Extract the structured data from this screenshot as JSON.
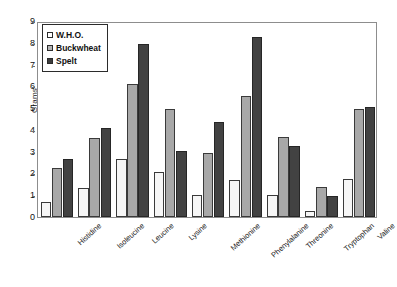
{
  "chart_data": {
    "type": "bar",
    "title": "",
    "xlabel": "",
    "ylabel": "Grams",
    "ylim": [
      0,
      9
    ],
    "yticks": [
      0,
      1,
      2,
      3,
      4,
      5,
      6,
      7,
      8,
      9
    ],
    "grid": false,
    "legend_position": "top-left",
    "categories": [
      "Histidine",
      "Isoleucine",
      "Leucine",
      "Lysine",
      "Methionine",
      "Phenylalanine",
      "Threonine",
      "Tryptophan",
      "Valine"
    ],
    "series": [
      {
        "name": "W.H.O.",
        "color": "#f6f6f6",
        "values": [
          0.7,
          1.35,
          2.65,
          2.05,
          1.0,
          1.7,
          1.0,
          0.27,
          1.75
        ]
      },
      {
        "name": "Buckwheat",
        "color": "#a8a8a8",
        "values": [
          2.27,
          3.63,
          6.1,
          4.95,
          2.95,
          5.57,
          3.68,
          1.4,
          4.95
        ]
      },
      {
        "name": "Spelt",
        "color": "#424242",
        "values": [
          2.68,
          4.1,
          7.95,
          3.05,
          4.35,
          8.28,
          3.25,
          0.97,
          5.05
        ]
      }
    ]
  },
  "legend": {
    "items": [
      {
        "label": "W.H.O."
      },
      {
        "label": "Buckwheat"
      },
      {
        "label": "Spelt"
      }
    ]
  }
}
